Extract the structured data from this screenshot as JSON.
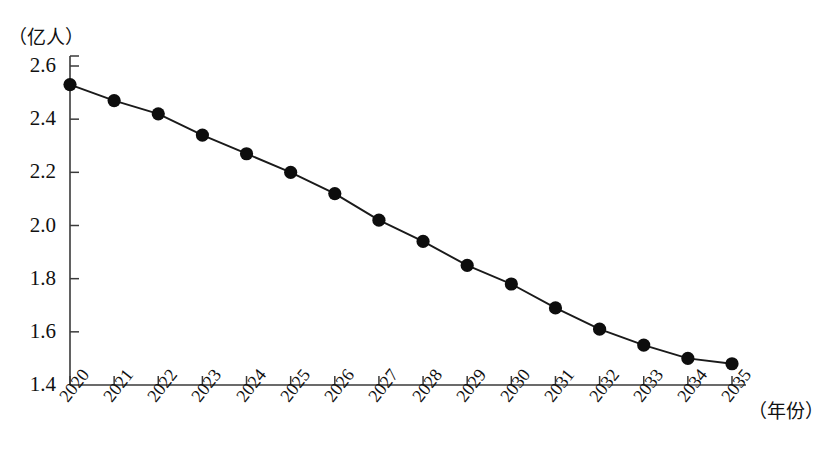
{
  "axes": {
    "y_unit_label": "（亿人）",
    "x_unit_label": "（年份）",
    "y_ticks": [
      "2.6",
      "2.4",
      "2.2",
      "2.0",
      "1.8",
      "1.6",
      "1.4"
    ],
    "x_ticks": [
      "2020",
      "2021",
      "2022",
      "2023",
      "2024",
      "2025",
      "2026",
      "2027",
      "2028",
      "2029",
      "2030",
      "2031",
      "2032",
      "2033",
      "2034",
      "2035"
    ]
  },
  "style": {
    "line_color": "#1a1a1a",
    "marker_color": "#0d0d0d",
    "axis_color": "#3a3a3a",
    "background": "#ffffff"
  },
  "caption": {
    "text": ""
  },
  "chart_data": {
    "type": "line",
    "title": "",
    "subtitle": "",
    "xlabel": "（年份）",
    "ylabel": "（亿人）",
    "xlim": [
      2020,
      2035
    ],
    "ylim": [
      1.4,
      2.6
    ],
    "grid": false,
    "legend": false,
    "legend_position": "none",
    "markers": "filled-circle",
    "x": [
      2020,
      2021,
      2022,
      2023,
      2024,
      2025,
      2026,
      2027,
      2028,
      2029,
      2030,
      2031,
      2032,
      2033,
      2034,
      2035
    ],
    "categories": [
      "2020",
      "2021",
      "2022",
      "2023",
      "2024",
      "2025",
      "2026",
      "2027",
      "2028",
      "2029",
      "2030",
      "2031",
      "2032",
      "2033",
      "2034",
      "2035"
    ],
    "values": [
      2.53,
      2.47,
      2.42,
      2.34,
      2.27,
      2.2,
      2.12,
      2.02,
      1.94,
      1.85,
      1.78,
      1.69,
      1.61,
      1.55,
      1.5,
      1.48
    ],
    "series": [
      {
        "name": "人口",
        "values": [
          2.53,
          2.47,
          2.42,
          2.34,
          2.27,
          2.2,
          2.12,
          2.02,
          1.94,
          1.85,
          1.78,
          1.69,
          1.61,
          1.55,
          1.5,
          1.48
        ]
      }
    ],
    "y_tick_values": [
      2.6,
      2.4,
      2.2,
      2.0,
      1.8,
      1.6,
      1.4
    ],
    "annotations": []
  }
}
